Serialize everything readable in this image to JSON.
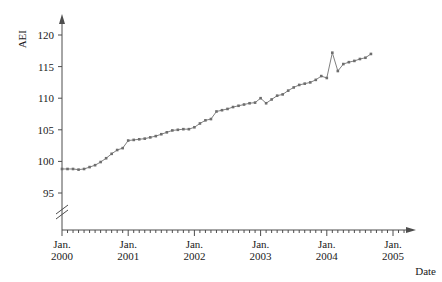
{
  "chart_data": {
    "type": "line",
    "title": "",
    "subtitle": "",
    "xlabel": "Date",
    "ylabel": "AEI",
    "ylim": [
      93,
      122
    ],
    "yticks": [
      95,
      100,
      105,
      110,
      115,
      120
    ],
    "ytick_labels": [
      "95",
      "100",
      "105",
      "110",
      "115",
      "120"
    ],
    "y_axis_break": true,
    "y_axis_break_note": "axis broken below 95",
    "grid": false,
    "legend": null,
    "legend_position": "none",
    "xtick_labels": [
      "Jan.\n2000",
      "Jan.\n2001",
      "Jan.\n2002",
      "Jan.\n2003",
      "Jan.\n2004",
      "Jan.\n2005"
    ],
    "xticks_major": [
      "2000-01",
      "2001-01",
      "2002-01",
      "2003-01",
      "2004-01",
      "2005-01"
    ],
    "xtick_label_lines": [
      [
        "Jan.",
        "2000"
      ],
      [
        "Jan.",
        "2001"
      ],
      [
        "Jan.",
        "2002"
      ],
      [
        "Jan.",
        "2003"
      ],
      [
        "Jan.",
        "2004"
      ],
      [
        "Jan.",
        "2005"
      ]
    ],
    "x_minor_ticks": "monthly",
    "xlim": [
      "2000-01",
      "2005-03"
    ],
    "series": [
      {
        "name": "AEI",
        "color": "#808080",
        "marker": "square",
        "x": [
          "2000-01",
          "2000-02",
          "2000-03",
          "2000-04",
          "2000-05",
          "2000-06",
          "2000-07",
          "2000-08",
          "2000-09",
          "2000-10",
          "2000-11",
          "2000-12",
          "2001-01",
          "2001-02",
          "2001-03",
          "2001-04",
          "2001-05",
          "2001-06",
          "2001-07",
          "2001-08",
          "2001-09",
          "2001-10",
          "2001-11",
          "2001-12",
          "2002-01",
          "2002-02",
          "2002-03",
          "2002-04",
          "2002-05",
          "2002-06",
          "2002-07",
          "2002-08",
          "2002-09",
          "2002-10",
          "2002-11",
          "2002-12",
          "2003-01",
          "2003-02",
          "2003-03",
          "2003-04",
          "2003-05",
          "2003-06",
          "2003-07",
          "2003-08",
          "2003-09",
          "2003-10",
          "2003-11",
          "2003-12",
          "2004-01",
          "2004-02",
          "2004-03",
          "2004-04",
          "2004-05",
          "2004-06",
          "2004-07",
          "2004-08",
          "2004-09"
        ],
        "values": [
          98.8,
          98.8,
          98.8,
          98.7,
          98.8,
          99.1,
          99.4,
          99.9,
          100.5,
          101.2,
          101.8,
          102.1,
          103.3,
          103.4,
          103.5,
          103.6,
          103.8,
          104.0,
          104.3,
          104.6,
          104.9,
          105.0,
          105.1,
          105.1,
          105.4,
          106.0,
          106.5,
          106.7,
          107.9,
          108.1,
          108.3,
          108.6,
          108.8,
          109.0,
          109.2,
          109.3,
          110.0,
          109.2,
          109.8,
          110.4,
          110.6,
          111.2,
          111.7,
          112.1,
          112.3,
          112.5,
          112.9,
          113.5,
          113.2,
          117.2,
          114.3,
          115.4,
          115.7,
          115.9,
          116.2,
          116.4,
          117.0
        ]
      }
    ]
  }
}
